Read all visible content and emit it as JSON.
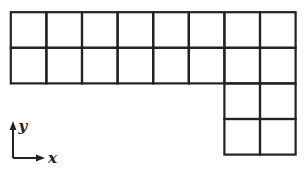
{
  "figure": {
    "background": "#ffffff",
    "line_color": "#222222",
    "line_width": 2.2
  },
  "grid": {
    "cell_size": 35.6,
    "origin": {
      "x": 10.8,
      "y": 12.2
    },
    "columns": 8,
    "rows": 4,
    "blocks": [
      {
        "name": "top-rectangle",
        "col_start": 0,
        "row_start": 0,
        "cols": 8,
        "rows": 2
      },
      {
        "name": "bottom-right-square",
        "col_start": 6,
        "row_start": 2,
        "cols": 2,
        "rows": 2
      }
    ],
    "total_squares": 20
  },
  "axes": {
    "x_label": "x",
    "y_label": "y",
    "origin": {
      "x": 13,
      "y": 158
    },
    "y_arrow_tip": {
      "x": 13,
      "y": 121
    },
    "x_arrow_tip": {
      "x": 45,
      "y": 158
    }
  }
}
